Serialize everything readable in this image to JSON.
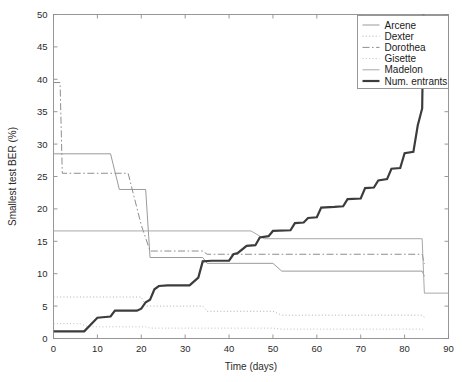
{
  "chart_data": {
    "type": "line",
    "title": "",
    "xlabel": "Time (days)",
    "ylabel": "Smallest test BER (%)",
    "xlim": [
      0,
      90
    ],
    "ylim": [
      0,
      50
    ],
    "xticks": [
      0,
      10,
      20,
      30,
      40,
      50,
      60,
      70,
      80,
      90
    ],
    "yticks": [
      0,
      5,
      10,
      15,
      20,
      25,
      30,
      35,
      40,
      45,
      50
    ],
    "grid": false,
    "legend_position": "top-right",
    "series": [
      {
        "name": "Arcene",
        "style": "solid",
        "color": "#9a9a9a",
        "width": 1,
        "points": [
          [
            0,
            28.5
          ],
          [
            13,
            28.5
          ],
          [
            15,
            23.0
          ],
          [
            21,
            23.0
          ],
          [
            22,
            12.5
          ],
          [
            34,
            12.5
          ],
          [
            35,
            11.6
          ],
          [
            50,
            11.6
          ],
          [
            52,
            10.4
          ],
          [
            84,
            10.4
          ],
          [
            84.5,
            9.6
          ]
        ]
      },
      {
        "name": "Dexter",
        "style": "dotted",
        "color": "#b5b5b5",
        "width": 1,
        "points": [
          [
            0,
            6.4
          ],
          [
            20,
            6.4
          ],
          [
            21,
            5.0
          ],
          [
            34,
            5.0
          ],
          [
            35,
            4.2
          ],
          [
            50,
            4.2
          ],
          [
            52,
            3.6
          ],
          [
            84,
            3.6
          ],
          [
            84.5,
            3.3
          ]
        ]
      },
      {
        "name": "Dorothea",
        "style": "dashdot",
        "color": "#8e8e8e",
        "width": 1,
        "points": [
          [
            0,
            39.5
          ],
          [
            1.5,
            39.5
          ],
          [
            2,
            25.5
          ],
          [
            17,
            25.5
          ],
          [
            20,
            17.5
          ],
          [
            22,
            13.5
          ],
          [
            34,
            13.5
          ],
          [
            35,
            13.0
          ],
          [
            84,
            13.0
          ],
          [
            84.5,
            11.5
          ]
        ]
      },
      {
        "name": "Gisette",
        "style": "dotted",
        "color": "#c4c4c4",
        "width": 1,
        "points": [
          [
            0,
            2.3
          ],
          [
            6,
            2.3
          ],
          [
            8,
            1.8
          ],
          [
            21,
            1.8
          ],
          [
            22,
            1.6
          ],
          [
            50,
            1.6
          ],
          [
            52,
            1.45
          ],
          [
            84,
            1.45
          ],
          [
            84.5,
            1.3
          ]
        ]
      },
      {
        "name": "Madelon",
        "style": "solid",
        "color": "#a8a8a8",
        "width": 1,
        "points": [
          [
            0,
            16.6
          ],
          [
            45,
            16.6
          ],
          [
            48,
            15.4
          ],
          [
            84,
            15.4
          ],
          [
            84.5,
            7.0
          ],
          [
            90,
            7.0
          ]
        ]
      },
      {
        "name": "Num. entrants",
        "style": "solid",
        "color": "#3c3c3c",
        "width": 2.2,
        "points": [
          [
            0,
            1.1
          ],
          [
            7,
            1.1
          ],
          [
            10,
            3.2
          ],
          [
            13,
            3.4
          ],
          [
            14,
            4.3
          ],
          [
            19,
            4.3
          ],
          [
            20,
            4.6
          ],
          [
            21,
            5.6
          ],
          [
            22,
            6.0
          ],
          [
            23,
            7.6
          ],
          [
            24,
            8.1
          ],
          [
            26,
            8.2
          ],
          [
            31,
            8.2
          ],
          [
            33,
            9.4
          ],
          [
            34,
            11.9
          ],
          [
            36,
            12.0
          ],
          [
            40,
            12.0
          ],
          [
            41,
            13.0
          ],
          [
            42,
            13.2
          ],
          [
            44,
            14.3
          ],
          [
            46,
            14.4
          ],
          [
            47,
            15.6
          ],
          [
            49,
            15.8
          ],
          [
            50,
            16.6
          ],
          [
            54,
            16.7
          ],
          [
            55,
            17.8
          ],
          [
            57,
            17.9
          ],
          [
            58,
            18.6
          ],
          [
            60,
            18.7
          ],
          [
            61,
            20.2
          ],
          [
            64,
            20.3
          ],
          [
            66,
            20.4
          ],
          [
            67,
            21.5
          ],
          [
            70,
            21.6
          ],
          [
            71,
            23.2
          ],
          [
            73,
            23.3
          ],
          [
            74,
            24.4
          ],
          [
            76,
            24.6
          ],
          [
            77,
            26.2
          ],
          [
            79,
            26.3
          ],
          [
            80,
            28.6
          ],
          [
            82,
            28.8
          ],
          [
            83,
            32.9
          ],
          [
            84,
            35.5
          ],
          [
            84.3,
            50.0
          ]
        ]
      }
    ]
  },
  "legend": {
    "entries": [
      {
        "label": "Arcene"
      },
      {
        "label": "Dexter"
      },
      {
        "label": "Dorothea"
      },
      {
        "label": "Gisette"
      },
      {
        "label": "Madelon"
      },
      {
        "label": "Num. entrants"
      }
    ]
  }
}
